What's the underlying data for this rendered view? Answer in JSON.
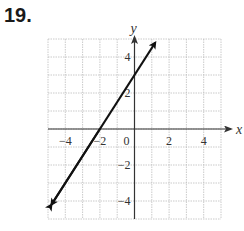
{
  "problem_number": "19.",
  "chart_data": {
    "type": "line",
    "title": "",
    "xlabel": "x",
    "ylabel": "y",
    "xlim": [
      -5,
      5
    ],
    "ylim": [
      -5,
      5
    ],
    "grid": true,
    "x_ticks": [
      -4,
      -2,
      0,
      2,
      4
    ],
    "y_ticks": [
      -4,
      -2,
      2,
      4
    ],
    "series": [
      {
        "name": "line",
        "equation": "y = 1.5x + 3",
        "slope": 1.5,
        "intercept": 3,
        "x": [
          -4.8,
          -2,
          0,
          1.2
        ],
        "y": [
          -4.2,
          0,
          3,
          4.8
        ],
        "arrows": "both"
      }
    ],
    "tick_labels": {
      "x": [
        "-4",
        "-2",
        "0",
        "2",
        "4"
      ],
      "y": [
        "-4",
        "-2",
        "2",
        "4"
      ]
    }
  },
  "colors": {
    "grid": "#bdbdbd",
    "axis": "#333333",
    "line": "#111111"
  }
}
